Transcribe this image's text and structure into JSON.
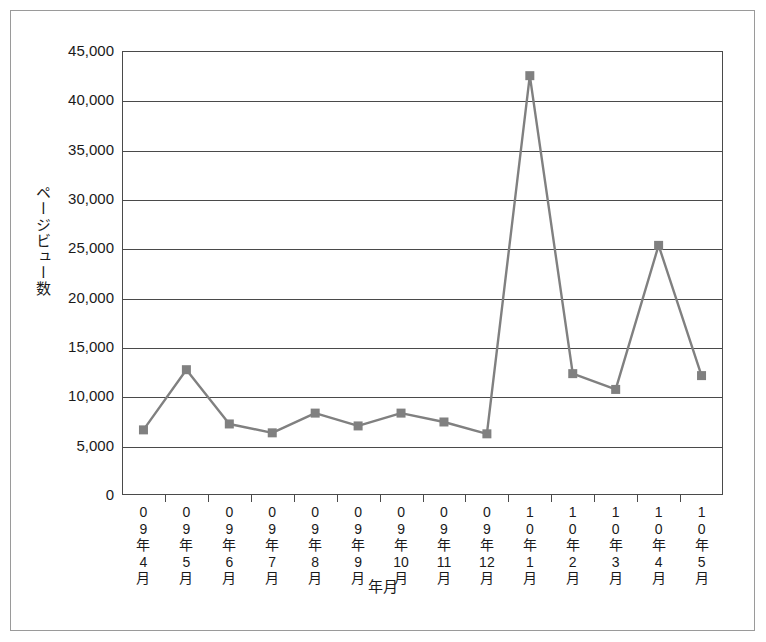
{
  "chart_data": {
    "type": "line",
    "title": "",
    "xlabel": "年月",
    "ylabel": "ページビュー数",
    "categories": [
      "09年4月",
      "09年5月",
      "09年6月",
      "09年7月",
      "09年8月",
      "09年9月",
      "09年10月",
      "09年11月",
      "09年12月",
      "10年1月",
      "10年2月",
      "10年3月",
      "10年4月",
      "10年5月"
    ],
    "category_lines": [
      [
        "0",
        "9",
        "年",
        "4",
        "月"
      ],
      [
        "0",
        "9",
        "年",
        "5",
        "月"
      ],
      [
        "0",
        "9",
        "年",
        "6",
        "月"
      ],
      [
        "0",
        "9",
        "年",
        "7",
        "月"
      ],
      [
        "0",
        "9",
        "年",
        "8",
        "月"
      ],
      [
        "0",
        "9",
        "年",
        "9",
        "月"
      ],
      [
        "0",
        "9",
        "年",
        "10",
        "月"
      ],
      [
        "0",
        "9",
        "年",
        "11",
        "月"
      ],
      [
        "0",
        "9",
        "年",
        "12",
        "月"
      ],
      [
        "1",
        "0",
        "年",
        "1",
        "月"
      ],
      [
        "1",
        "0",
        "年",
        "2",
        "月"
      ],
      [
        "1",
        "0",
        "年",
        "3",
        "月"
      ],
      [
        "1",
        "0",
        "年",
        "4",
        "月"
      ],
      [
        "1",
        "0",
        "年",
        "5",
        "月"
      ]
    ],
    "values": [
      6600,
      12700,
      7200,
      6300,
      8300,
      7000,
      8300,
      7400,
      6200,
      42500,
      12300,
      10700,
      25300,
      12100
    ],
    "ylim": [
      0,
      45000
    ],
    "ytick_values": [
      0,
      5000,
      10000,
      15000,
      20000,
      25000,
      30000,
      35000,
      40000,
      45000
    ],
    "ytick_labels": [
      "0",
      "5,000",
      "10,000",
      "15,000",
      "20,000",
      "25,000",
      "30,000",
      "35,000",
      "40,000",
      "45,000"
    ],
    "grid": true,
    "legend": "none",
    "series_color": "#808080",
    "marker": "square",
    "axis_color": "#4a4a4a",
    "background": "#ffffff"
  }
}
